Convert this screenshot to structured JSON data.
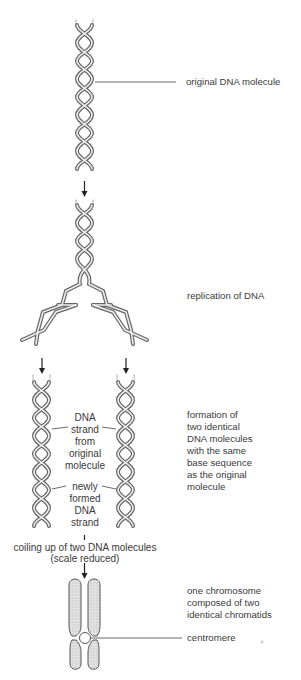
{
  "labels": {
    "original": "original DNA molecule",
    "replication": "replication of DNA",
    "formation": "formation of\ntwo identical\nDNA molecules\nwith the same\nbase sequence\nas the original\nmolecule",
    "strand_from_original": "DNA\nstrand\nfrom\noriginal\nmolecule",
    "newly_formed": "newly\nformed\nDNA\nstrand",
    "coiling": "coiling up of two DNA molecules",
    "scale": "(scale reduced)",
    "chromosome": "one chromosome\ncomposed of two\nidentical chromatids",
    "centromere": "centromere"
  },
  "colors": {
    "strand": "#7a7a7a",
    "strand_light": "#d8d8d8",
    "chromatid_fill": "#d4d4d4",
    "line": "#444444"
  }
}
